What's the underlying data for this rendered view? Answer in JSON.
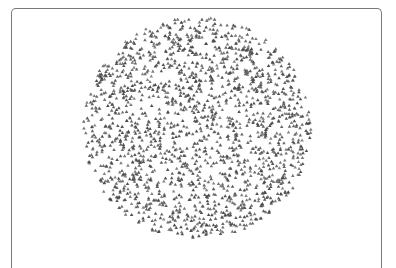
{
  "chart_data": {
    "type": "scatter",
    "title": "",
    "xlabel": "",
    "ylabel": "",
    "grid": false,
    "legend": null,
    "axes_visible": false,
    "marker": "triangle",
    "marker_color": "#4a4a4a",
    "marker_size_px": 3.2,
    "point_count": 1800,
    "distribution": "uniform-disc",
    "region": {
      "center_x_px": 197,
      "center_y_px": 128,
      "radius_x_px": 114,
      "radius_y_px": 111
    },
    "seed": 42
  },
  "frame": {
    "border_color": "#7a7a7a"
  }
}
